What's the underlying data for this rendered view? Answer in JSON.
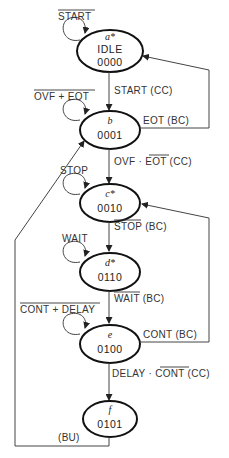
{
  "states": [
    {
      "id": "a*",
      "name": "IDLE",
      "code": "0000",
      "self_loop": "START",
      "self_loop_overbar": true
    },
    {
      "id": "b",
      "name": "",
      "code": "0001",
      "self_loop": "OVF + EOT",
      "self_loop_overbar": true
    },
    {
      "id": "c*",
      "name": "",
      "code": "0010",
      "self_loop": "STOP",
      "self_loop_overbar": false
    },
    {
      "id": "d*",
      "name": "",
      "code": "0110",
      "self_loop": "WAIT",
      "self_loop_overbar": false
    },
    {
      "id": "e",
      "name": "",
      "code": "0100",
      "self_loop": "CONT + DELAY",
      "self_loop_overbar": true
    },
    {
      "id": "f",
      "name": "",
      "code": "0101",
      "self_loop": "",
      "self_loop_overbar": false
    }
  ],
  "transitions": [
    {
      "from": "a",
      "to": "b",
      "label": "START (CC)"
    },
    {
      "from": "b",
      "to": "a",
      "label": "EOT (BC)"
    },
    {
      "from": "b",
      "to": "c",
      "label_prefix": "OVF · ",
      "label_over": "EOT",
      "label_suffix": " (CC)"
    },
    {
      "from": "c",
      "to": "d",
      "label_over": "STOP",
      "label_suffix": " (BC)"
    },
    {
      "from": "d",
      "to": "e",
      "label_over": "WAIT",
      "label_suffix": " (BC)"
    },
    {
      "from": "e",
      "to": "c",
      "label": "CONT (BC)"
    },
    {
      "from": "e",
      "to": "f",
      "label_prefix": "DELAY · ",
      "label_over": "CONT",
      "label_suffix": " (CC)"
    },
    {
      "from": "f",
      "to": "b",
      "label": "(BU)"
    }
  ],
  "labels": {
    "a_loop": "START",
    "a_id": "a*",
    "a_name": "IDLE",
    "a_code": "0000",
    "ab": "START (CC)",
    "b_loop": "OVF + EOT",
    "b_id": "b",
    "b_code": "0001",
    "ba": "EOT (BC)",
    "bc_pre": "OVF · ",
    "bc_over": "EOT",
    "bc_suf": " (CC)",
    "c_loop": "STOP",
    "c_id": "c*",
    "c_code": "0010",
    "cd_over": "STOP",
    "cd_suf": " (BC)",
    "d_loop": "WAIT",
    "d_id": "d*",
    "d_code": "0110",
    "de_over": "WAIT",
    "de_suf": " (BC)",
    "e_loop": "CONT + DELAY",
    "e_id": "e",
    "e_code": "0100",
    "ec": "CONT (BC)",
    "ef_pre": "DELAY · ",
    "ef_over": "CONT",
    "ef_suf": " (CC)",
    "f_id": "f",
    "f_code": "0101",
    "fb": "(BU)"
  }
}
